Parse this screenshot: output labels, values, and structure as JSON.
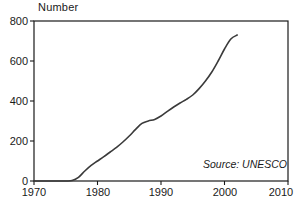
{
  "chart_data": {
    "type": "line",
    "title": "",
    "subtitle": "",
    "ylabel": "Number",
    "xlabel": "",
    "xlim": [
      1970,
      2010
    ],
    "ylim": [
      0,
      800
    ],
    "xticks": [
      1970,
      1980,
      1990,
      2000,
      2010
    ],
    "yticks": [
      0,
      200,
      400,
      600,
      800
    ],
    "grid": false,
    "legend": null,
    "annotations": [
      {
        "text": "Source: UNESCO",
        "position": "bottom-right",
        "style": "italic"
      }
    ],
    "series": [
      {
        "name": "Number",
        "color": "#3a3a3a",
        "x": [
          1970,
          1972,
          1974,
          1975,
          1976,
          1977,
          1978,
          1979,
          1980,
          1981,
          1982,
          1983,
          1984,
          1985,
          1986,
          1987,
          1988,
          1989,
          1990,
          1991,
          1992,
          1993,
          1994,
          1995,
          1996,
          1997,
          1998,
          1999,
          2000,
          2001,
          2002
        ],
        "values": [
          0,
          0,
          0,
          0,
          2,
          18,
          50,
          78,
          100,
          122,
          145,
          168,
          195,
          225,
          258,
          288,
          300,
          308,
          325,
          348,
          370,
          390,
          408,
          430,
          462,
          500,
          545,
          600,
          660,
          710,
          730
        ]
      }
    ]
  },
  "axis": {
    "ylabel_text": "Number",
    "ytick_labels": [
      "800",
      "600",
      "400",
      "200",
      "0"
    ],
    "xtick_labels": [
      "1970",
      "1980",
      "1990",
      "2000",
      "2010"
    ]
  },
  "source": {
    "text": "Source: UNESCO"
  },
  "colors": {
    "line": "#3a3a3a",
    "axis": "#1a1a1a",
    "background": "#ffffff"
  }
}
